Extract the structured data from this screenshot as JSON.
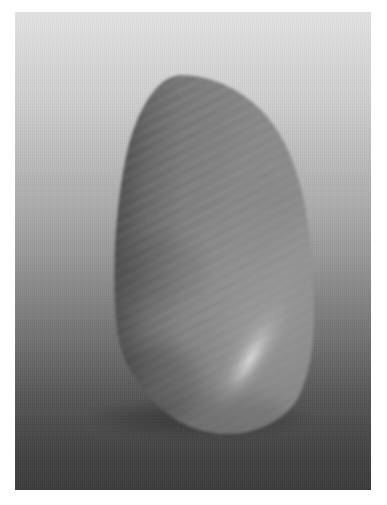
{
  "image": {
    "title": "Grayscale 3D render of an organic ridged pod form",
    "kind": "3d-render",
    "colorspace": "grayscale",
    "width_px": 387,
    "height_px": 505
  },
  "plate": {
    "name": "render-plate",
    "x_px": 15,
    "y_px": 12,
    "width_px": 356,
    "height_px": 478,
    "page_margin_color": "#ffffff"
  },
  "background": {
    "type": "vertical-gradient",
    "direction": "top-to-bottom",
    "top_color": "#e3e3e3",
    "upper_mid_color": "#bdbdbd",
    "mid_color": "#949494",
    "lower_mid_color": "#6a6a6a",
    "bottom_color": "#3c3c3c",
    "has_fine_vertical_banding": "yes",
    "has_horizontal_scanlines": "yes"
  },
  "object": {
    "name": "ridged-pod",
    "description": "Tall teardrop / shell-like solid, apex upper-left, broad lower-right lobe",
    "bounds": {
      "left_px": 100,
      "top_px": 62,
      "right_px": 300,
      "bottom_px": 422
    },
    "surface": {
      "texture": "corrugated wavy ridges",
      "ridge_direction": "upper-left to lower-right diagonal bands",
      "ridge_spacing_px": 7,
      "ridge_contrast": "low",
      "most_visible_region": "left and lower-left flank"
    },
    "shading": {
      "base_fill_top": "#8d8d8d",
      "base_fill_mid": "#7a7a7a",
      "base_fill_bottom": "#636363",
      "shadow_edge_color": "#4e4e4e",
      "terminator_color": "#585858",
      "highlight_color": "#b9b9b9",
      "specular_streak": {
        "present": "yes",
        "location": "lower-right quadrant",
        "orientation": "diagonal, running lower-left to upper-right",
        "center_x_px": 235,
        "center_y_px": 345,
        "peak_color": "#c2c2c2"
      },
      "rim_light": {
        "present": "yes",
        "location": "upper-right silhouette edge",
        "color": "#a0a0a0"
      }
    },
    "silhouette_points": [
      [
        168,
        63
      ],
      [
        196,
        66
      ],
      [
        222,
        78
      ],
      [
        244,
        96
      ],
      [
        262,
        120
      ],
      [
        276,
        150
      ],
      [
        286,
        184
      ],
      [
        293,
        222
      ],
      [
        297,
        262
      ],
      [
        299,
        300
      ],
      [
        298,
        334
      ],
      [
        293,
        362
      ],
      [
        283,
        385
      ],
      [
        268,
        403
      ],
      [
        248,
        414
      ],
      [
        226,
        420
      ],
      [
        202,
        422
      ],
      [
        180,
        418
      ],
      [
        162,
        408
      ],
      [
        147,
        394
      ],
      [
        134,
        379
      ],
      [
        124,
        368
      ],
      [
        116,
        360
      ],
      [
        109,
        348
      ],
      [
        104,
        326
      ],
      [
        101,
        298
      ],
      [
        100,
        266
      ],
      [
        101,
        232
      ],
      [
        104,
        198
      ],
      [
        109,
        164
      ],
      [
        117,
        132
      ],
      [
        128,
        104
      ],
      [
        142,
        82
      ],
      [
        155,
        69
      ]
    ]
  },
  "shadow": {
    "name": "contact-shadow",
    "present": "yes",
    "color": "rgba(0,0,0,0.28)",
    "blur_px": 5
  }
}
